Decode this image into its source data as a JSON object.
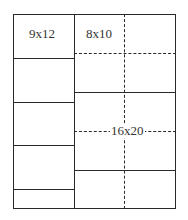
{
  "diagram": {
    "labels": {
      "small": "9x12",
      "medium": "8x10",
      "large": "16x20"
    },
    "colors": {
      "line": "#2a2a2a",
      "text": "#333333",
      "background": "#ffffff"
    }
  }
}
